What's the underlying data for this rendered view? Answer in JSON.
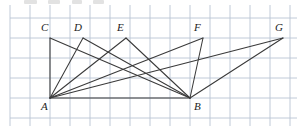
{
  "figure": {
    "canvas": {
      "width": 307,
      "height": 129
    },
    "colors": {
      "background": "#ffffff",
      "grid_line": "#b9c4d4",
      "figure_line": "#3a3a3a",
      "label_text": "#1c1c1c"
    },
    "grid": {
      "visible": true,
      "cell_size": 20,
      "x_start": 10,
      "x_end": 297,
      "y_start": 5,
      "y_end": 126,
      "vertical_lines": [
        10,
        30,
        50,
        70,
        90,
        110,
        130,
        150,
        170,
        190,
        210,
        230,
        250,
        270,
        290
      ],
      "horizontal_lines": [
        18,
        38,
        58,
        78,
        98,
        118
      ]
    },
    "points": [
      {
        "name": "A",
        "x": 50,
        "y": 98,
        "label_dx": -9,
        "label_dy": 3
      },
      {
        "name": "B",
        "x": 190,
        "y": 98,
        "label_dx": 4,
        "label_dy": 3
      },
      {
        "name": "C",
        "x": 50,
        "y": 38,
        "label_dx": -9,
        "label_dy": -16
      },
      {
        "name": "D",
        "x": 83,
        "y": 38,
        "label_dx": -9,
        "label_dy": -16
      },
      {
        "name": "E",
        "x": 126,
        "y": 38,
        "label_dx": -9,
        "label_dy": -16
      },
      {
        "name": "F",
        "x": 203,
        "y": 38,
        "label_dx": -9,
        "label_dy": -16
      },
      {
        "name": "G",
        "x": 283,
        "y": 38,
        "label_dx": -8,
        "label_dy": -16
      }
    ],
    "segments": [
      {
        "name": "base-AB",
        "from": "A",
        "to": "B"
      },
      {
        "name": "CA",
        "from": "C",
        "to": "A"
      },
      {
        "name": "CB",
        "from": "C",
        "to": "B"
      },
      {
        "name": "DA",
        "from": "D",
        "to": "A"
      },
      {
        "name": "DB",
        "from": "D",
        "to": "B"
      },
      {
        "name": "EA",
        "from": "E",
        "to": "A"
      },
      {
        "name": "EB",
        "from": "E",
        "to": "B"
      },
      {
        "name": "FA",
        "from": "F",
        "to": "A"
      },
      {
        "name": "FB",
        "from": "F",
        "to": "B"
      },
      {
        "name": "GA",
        "from": "G",
        "to": "A"
      },
      {
        "name": "GB",
        "from": "G",
        "to": "B"
      }
    ],
    "top_smudges": [
      {
        "left": 24,
        "width": 13
      },
      {
        "left": 48,
        "width": 12
      },
      {
        "left": 72,
        "width": 10
      },
      {
        "left": 93,
        "width": 11
      }
    ]
  }
}
